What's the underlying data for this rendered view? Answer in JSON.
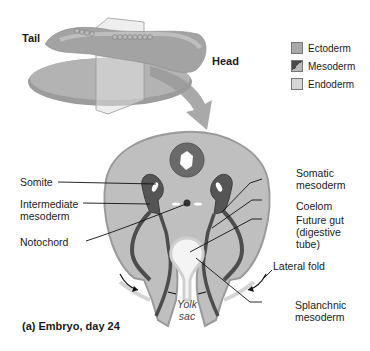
{
  "figure": {
    "caption": "(a) Embryo, day 24",
    "top_view": {
      "tail_label": "Tail",
      "head_label": "Head"
    },
    "legend": [
      {
        "label": "Ectoderm",
        "color": "#a9a9a9"
      },
      {
        "label": "Mesoderm",
        "color": "#4a4a4a",
        "color2": "#b8b8b8"
      },
      {
        "label": "Endoderm",
        "color": "#d6d6d6"
      }
    ],
    "labels_left": [
      "Somite",
      "Intermediate",
      "mesoderm",
      "Notochord"
    ],
    "labels_right": {
      "somatic": [
        "Somatic",
        "mesoderm"
      ],
      "coelom": "Coelom",
      "gut": [
        "Future gut",
        "(digestive",
        "tube)"
      ],
      "lateral_fold": "Lateral fold",
      "splanchnic": [
        "Splanchnic",
        "mesoderm"
      ]
    },
    "yolk_sac": [
      "Yolk",
      "sac"
    ],
    "colors": {
      "ectoderm": "#a9a9a9",
      "mesoderm": "#4d4d4d",
      "endoderm": "#d4d4d4",
      "body_fill": "#bdbdbd",
      "arrow": "#9a9a9a"
    }
  }
}
